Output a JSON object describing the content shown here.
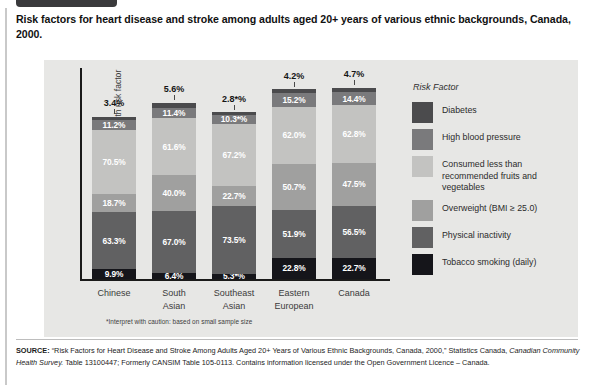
{
  "title": "Risk factors for heart disease and stroke among adults aged 20+ years of various ethnic backgrounds, Canada, 2000.",
  "colors": {
    "panel_bg": "#e7e7e5",
    "diabetes": "#4b4b4d",
    "high_blood_pressure": "#7a7a7c",
    "fruits_vegetables": "#c3c3c1",
    "overweight": "#a0a09f",
    "physical_inactivity": "#616162",
    "tobacco_smoking": "#15151a",
    "axis": "#1a1a1a"
  },
  "axes": {
    "ylabel": "Percent of population with risk factor",
    "footnote": "*Interpret with caution: based on small sample size"
  },
  "legend": {
    "title": "Risk Factor",
    "items": [
      {
        "label": "Diabetes",
        "color": "#4b4b4d"
      },
      {
        "label": "High blood pressure",
        "color": "#7a7a7c"
      },
      {
        "label": "Consumed less than recommended fruits and vegetables",
        "color": "#c3c3c1"
      },
      {
        "label": "Overweight (BMI ≥ 25.0)",
        "color": "#a0a09f"
      },
      {
        "label": "Physical inactivity",
        "color": "#616162"
      },
      {
        "label": "Tobacco smoking (daily)",
        "color": "#15151a"
      }
    ]
  },
  "source": {
    "prefix": "SOURCE:",
    "part1": " “Risk Factors for Heart Disease and Stroke Among Adults Aged 20+ Years of Various Ethnic Backgrounds, Canada, 2000,” Statistics Canada, ",
    "italic": "Canadian Community Health Survey.",
    "part2": " Table 13100447; Formerly CANSIM Table 105-0113. Contains information licensed under the Open Government Licence – Canada."
  },
  "chart_data": {
    "type": "bar",
    "subtype": "stacked-vertical",
    "title": "Risk factors for heart disease and stroke among adults aged 20+ years of various ethnic backgrounds, Canada, 2000.",
    "xlabel": "",
    "ylabel": "Percent of population with risk factor",
    "grid": false,
    "legend_position": "right",
    "stack_order_bottom_to_top": [
      "Tobacco smoking (daily)",
      "Physical inactivity",
      "Overweight (BMI ≥ 25.0)",
      "Consumed less than recommended fruits and vegetables",
      "High blood pressure",
      "Diabetes"
    ],
    "categories": [
      "Chinese",
      "South Asian",
      "Southeast Asian",
      "Eastern European",
      "Canada"
    ],
    "category_lines": [
      [
        "Chinese"
      ],
      [
        "South",
        "Asian"
      ],
      [
        "Southeast",
        "Asian"
      ],
      [
        "Eastern",
        "European"
      ],
      [
        "Canada"
      ]
    ],
    "series": [
      {
        "name": "Tobacco smoking (daily)",
        "color": "#15151a",
        "values": [
          9.9,
          6.4,
          5.3,
          22.8,
          22.7
        ],
        "labels": [
          "9.9%",
          "6.4%",
          "5.3*%",
          "22.8%",
          "22.7%"
        ]
      },
      {
        "name": "Physical inactivity",
        "color": "#616162",
        "values": [
          63.3,
          67.0,
          73.5,
          51.9,
          56.5
        ],
        "labels": [
          "63.3%",
          "67.0%",
          "73.5%",
          "51.9%",
          "56.5%"
        ]
      },
      {
        "name": "Overweight (BMI ≥ 25.0)",
        "color": "#a0a09f",
        "values": [
          18.7,
          40.0,
          22.7,
          50.7,
          47.5
        ],
        "labels": [
          "18.7%",
          "40.0%",
          "22.7%",
          "50.7%",
          "47.5%"
        ]
      },
      {
        "name": "Consumed less than recommended fruits and vegetables",
        "color": "#c3c3c1",
        "values": [
          70.5,
          61.6,
          67.2,
          62.0,
          62.8
        ],
        "labels": [
          "70.5%",
          "61.6%",
          "67.2%",
          "62.0%",
          "62.8%"
        ]
      },
      {
        "name": "High blood pressure",
        "color": "#7a7a7c",
        "values": [
          11.2,
          11.4,
          10.3,
          15.2,
          14.4
        ],
        "labels": [
          "11.2%",
          "11.4%",
          "10.3*%",
          "15.2%",
          "14.4%"
        ]
      },
      {
        "name": "Diabetes",
        "color": "#4b4b4d",
        "values": [
          3.4,
          5.6,
          2.8,
          4.2,
          4.7
        ],
        "labels": [
          "3.4%",
          "5.6%",
          "2.8*%",
          "4.2%",
          "4.7%"
        ],
        "labels_outside": true
      }
    ],
    "column_totals": [
      177.0,
      192.0,
      181.8,
      206.8,
      208.6
    ],
    "note": "*Interpret with caution: based on small sample size"
  }
}
